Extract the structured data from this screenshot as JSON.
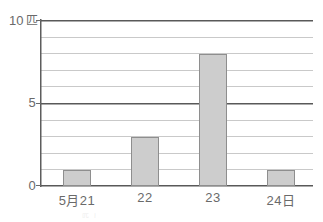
{
  "chart_data": {
    "type": "bar",
    "title": "",
    "subtitle": "",
    "xlabel": "",
    "ylabel": "匹",
    "categories": [
      "5月21",
      "22",
      "23",
      "24日"
    ],
    "values": [
      1,
      3,
      8,
      1
    ],
    "ylim": [
      0,
      10
    ],
    "y_ticks": [
      0,
      1,
      2,
      3,
      4,
      5,
      6,
      7,
      8,
      9,
      10
    ],
    "y_tick_labels_shown": [
      "0",
      "5",
      "10"
    ],
    "y_axis_unit_label": "10 匹",
    "grid": true,
    "grid_orientation": "horizontal",
    "major_gridlines": [
      0,
      5,
      10
    ],
    "legend": null,
    "legend_position": "none",
    "bar_fill_color": "#cdcdcd",
    "bar_border_color": "#8e8e8e",
    "major_line_color": "#595959",
    "minor_line_color": "#c9c9c9",
    "text_color": "#6a6a6a",
    "background_color": "#ffffff"
  },
  "axis": {
    "y": {
      "top_label_number": "10",
      "top_label_unit": "匹",
      "mid_label": "5",
      "bottom_label": "0"
    },
    "x": {
      "labels": [
        "5月21",
        "22",
        "23",
        "24日"
      ]
    }
  },
  "artifact": {
    "faint_text": "匹 しら"
  }
}
